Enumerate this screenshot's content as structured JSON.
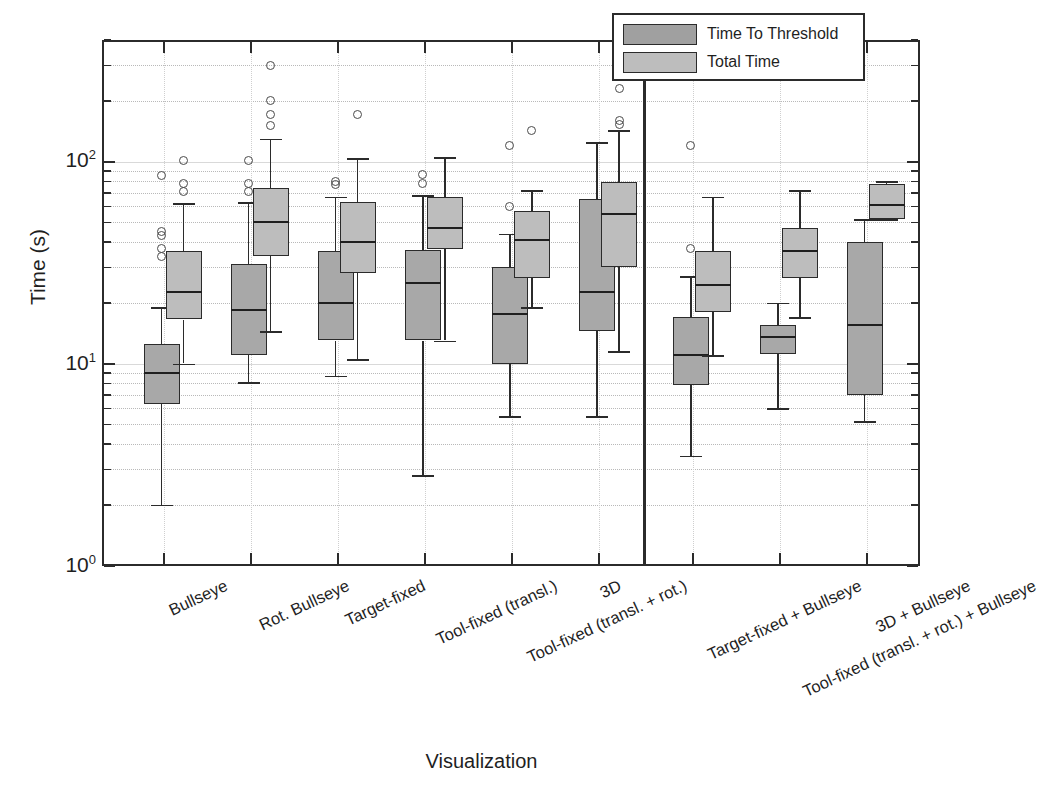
{
  "chart_data": {
    "type": "boxplot",
    "title": "",
    "xlabel": "Visualization",
    "ylabel": "Time (s)",
    "yscale": "log",
    "ylim": [
      1,
      400
    ],
    "ytick_labels": [
      "10",
      "10",
      "10"
    ],
    "ytick_exponents": [
      "0",
      "1",
      "2"
    ],
    "ytick_values": [
      1,
      10,
      100
    ],
    "grid": true,
    "legend_position": "top-right",
    "panel_divider_after_category": 5,
    "legend": [
      {
        "name": "Time To Threshold",
        "color": "#a8a8a8"
      },
      {
        "name": "Total Time",
        "color": "#bdbdbd"
      }
    ],
    "categories": [
      "Bullseye",
      "Rot. Bullseye",
      "Target-fixed",
      "Tool-fixed (transl.)",
      "Tool-fixed (transl. + rot.)",
      "3D",
      "Target-fixed + Bullseye",
      "Tool-fixed (transl. + rot.) + Bullseye",
      "3D + Bullseye"
    ],
    "series": [
      {
        "name": "Time To Threshold",
        "boxes": [
          {
            "category": "Bullseye",
            "whisker_low": 2.0,
            "q1": 6.3,
            "median": 9.0,
            "q3": 12.5,
            "whisker_high": 19.0,
            "outliers": [
              34.0,
              37.0,
              43.0,
              45.0,
              85.0
            ]
          },
          {
            "category": "Rot. Bullseye",
            "whisker_low": 8.1,
            "q1": 11.0,
            "median": 18.5,
            "q3": 31.0,
            "whisker_high": 63.0,
            "outliers": [
              71.0,
              78.0,
              101.0
            ]
          },
          {
            "category": "Target-fixed",
            "whisker_low": 8.7,
            "q1": 13.0,
            "median": 20.0,
            "q3": 36.0,
            "whisker_high": 67.0,
            "outliers": [
              77.0,
              80.0
            ]
          },
          {
            "category": "Tool-fixed (transl.)",
            "whisker_low": 2.8,
            "q1": 13.0,
            "median": 25.0,
            "q3": 36.5,
            "whisker_high": 68.0,
            "outliers": [
              78.0,
              86.0
            ]
          },
          {
            "category": "Tool-fixed (transl. + rot.)",
            "whisker_low": 5.5,
            "q1": 9.9,
            "median": 17.5,
            "q3": 30.0,
            "whisker_high": 44.0,
            "outliers": [
              60.0,
              120.0
            ]
          },
          {
            "category": "3D",
            "whisker_low": 5.5,
            "q1": 14.5,
            "median": 22.5,
            "q3": 65.0,
            "whisker_high": 125.0,
            "outliers": []
          },
          {
            "category": "Target-fixed + Bullseye",
            "whisker_low": 3.5,
            "q1": 7.8,
            "median": 11.0,
            "q3": 17.0,
            "whisker_high": 27.0,
            "outliers": [
              37.0,
              120.0
            ]
          },
          {
            "category": "Tool-fixed (transl. + rot.) + Bullseye",
            "whisker_low": 6.0,
            "q1": 11.2,
            "median": 13.5,
            "q3": 15.5,
            "whisker_high": 20.0,
            "outliers": []
          },
          {
            "category": "3D + Bullseye",
            "whisker_low": 5.2,
            "q1": 7.0,
            "median": 15.5,
            "q3": 40.0,
            "whisker_high": 52.0,
            "outliers": []
          }
        ]
      },
      {
        "name": "Total Time",
        "boxes": [
          {
            "category": "Bullseye",
            "whisker_low": 10.0,
            "q1": 16.5,
            "median": 22.5,
            "q3": 36.0,
            "whisker_high": 62.0,
            "outliers": [
              71.0,
              78.0,
              101.0
            ]
          },
          {
            "category": "Rot. Bullseye",
            "whisker_low": 14.5,
            "q1": 34.0,
            "median": 50.0,
            "q3": 74.0,
            "whisker_high": 130.0,
            "outliers": [
              150.0,
              170.0,
              200.0,
              300.0
            ]
          },
          {
            "category": "Target-fixed",
            "whisker_low": 10.5,
            "q1": 28.0,
            "median": 40.0,
            "q3": 63.0,
            "whisker_high": 104.0,
            "outliers": [
              170.0
            ]
          },
          {
            "category": "Tool-fixed (transl.)",
            "whisker_low": 13.0,
            "q1": 37.0,
            "median": 47.0,
            "q3": 67.0,
            "whisker_high": 105.0,
            "outliers": []
          },
          {
            "category": "Tool-fixed (transl. + rot.)",
            "whisker_low": 19.0,
            "q1": 26.5,
            "median": 41.0,
            "q3": 57.0,
            "whisker_high": 72.0,
            "outliers": [
              143.0
            ]
          },
          {
            "category": "3D",
            "whisker_low": 11.5,
            "q1": 30.0,
            "median": 55.0,
            "q3": 79.0,
            "whisker_high": 143.0,
            "outliers": [
              152.0,
              160.0,
              230.0,
              270.0,
              360.0
            ]
          },
          {
            "category": "Target-fixed + Bullseye",
            "whisker_low": 11.0,
            "q1": 18.0,
            "median": 24.5,
            "q3": 36.0,
            "whisker_high": 67.0,
            "outliers": []
          },
          {
            "category": "Tool-fixed (transl. + rot.) + Bullseye",
            "whisker_low": 17.0,
            "q1": 26.5,
            "median": 36.0,
            "q3": 47.0,
            "whisker_high": 72.0,
            "outliers": []
          },
          {
            "category": "3D + Bullseye",
            "whisker_low": 52.0,
            "q1": 52.0,
            "median": 61.0,
            "q3": 77.0,
            "whisker_high": 80.0,
            "outliers": []
          }
        ]
      }
    ]
  }
}
